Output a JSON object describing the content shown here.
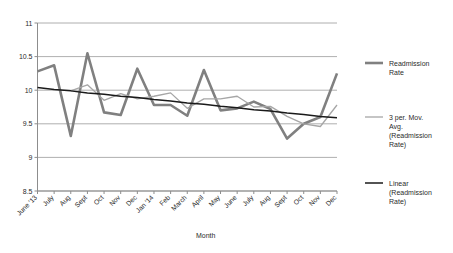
{
  "chart_data": {
    "type": "line",
    "title": "",
    "xlabel": "Month",
    "ylabel": "",
    "ylim": [
      8.5,
      11
    ],
    "yticks": [
      "8.5",
      "9",
      "9.5",
      "10",
      "10.5",
      "11"
    ],
    "grid": true,
    "legend_position": "right",
    "categories": [
      "June '13",
      "July",
      "Aug",
      "Sept",
      "Oct",
      "Nov",
      "Dec",
      "Jan '14",
      "Feb",
      "March",
      "April",
      "May",
      "June",
      "July",
      "Aug",
      "Sept",
      "Oct",
      "Nov",
      "Dec"
    ],
    "series": [
      {
        "name": "Readmission Rate",
        "color": "#808080",
        "width": 2.6,
        "values": [
          10.28,
          10.37,
          9.32,
          10.55,
          9.67,
          9.63,
          10.32,
          9.78,
          9.78,
          9.62,
          10.3,
          9.7,
          9.73,
          9.83,
          9.72,
          9.28,
          9.5,
          9.6,
          10.25
        ]
      },
      {
        "name": "3 per. Mov. Avg. (Readmission Rate)",
        "color": "#a6a6a6",
        "width": 1.3,
        "values": [
          null,
          null,
          9.99,
          10.08,
          9.85,
          9.95,
          9.87,
          9.91,
          9.96,
          9.73,
          9.87,
          9.87,
          9.91,
          9.75,
          9.76,
          9.61,
          9.5,
          9.46,
          9.78
        ]
      },
      {
        "name": "Linear (Readmission Rate)",
        "color": "#1a1a1a",
        "width": 1.5,
        "trend": true,
        "values": [
          10.04,
          10.01,
          9.99,
          9.96,
          9.94,
          9.91,
          9.89,
          9.86,
          9.84,
          9.81,
          9.79,
          9.76,
          9.74,
          9.71,
          9.69,
          9.66,
          9.64,
          9.61,
          9.59
        ]
      }
    ]
  },
  "legend": {
    "items": [
      {
        "label_line1": "Readmission",
        "label_line2": "Rate",
        "label_line3": "",
        "label_line4": ""
      },
      {
        "label_line1": "3 per. Mov.",
        "label_line2": "Avg.",
        "label_line3": "(Readmission",
        "label_line4": "Rate)"
      },
      {
        "label_line1": "Linear",
        "label_line2": "(Readmission",
        "label_line3": "Rate)",
        "label_line4": ""
      }
    ]
  }
}
